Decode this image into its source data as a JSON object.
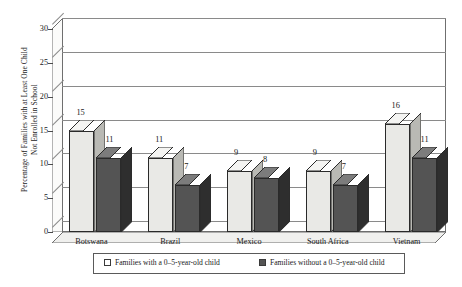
{
  "chart_data": {
    "type": "bar",
    "title": "",
    "xlabel": "",
    "ylabel": "Percentage of Families with at Least One Child Not Enrolled in School",
    "ylabel_line1": "Percentage of Families with at Least One Child",
    "ylabel_line2": "Not Enrolled in School",
    "ylim": [
      0,
      30
    ],
    "yticks": [
      30,
      25,
      20,
      15,
      10,
      5,
      0
    ],
    "grid": true,
    "legend_position": "bottom",
    "three_d": true,
    "categories": [
      "Botswana",
      "Brazil",
      "Mexico",
      "South Africa",
      "Vietnam"
    ],
    "series": [
      {
        "name": "Families with a 0–5-year-old child",
        "color": "#e9e9e6",
        "values": [
          15,
          11,
          9,
          9,
          16
        ]
      },
      {
        "name": "Families without a 0–5-year-old child",
        "color": "#545454",
        "values": [
          11,
          7,
          8,
          7,
          11
        ]
      }
    ]
  },
  "legend": {
    "entries": [
      {
        "label": "Families with a 0–5-year-old child",
        "swatch": "#ffffff"
      },
      {
        "label": "Families without a 0–5-year-old child",
        "swatch": "#545454"
      }
    ]
  },
  "colors": {
    "light_bar": "#e9e9e6",
    "light_bar_top": "#f4f4f2",
    "light_bar_side": "#b9b9b4",
    "dark_bar": "#545454",
    "dark_bar_top": "#7c7c7c",
    "dark_bar_side": "#2e2e2e",
    "axis": "#6f6f6f",
    "grid": "#8a8a8a",
    "floor": "#f0f0ee",
    "wall": "#fbfbfa",
    "text": "#1a1a1a"
  }
}
